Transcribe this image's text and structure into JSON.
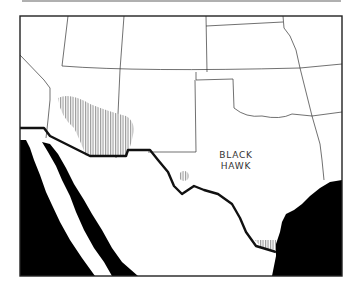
{
  "map": {
    "species_label_line1": "BLACK",
    "species_label_line2": "HAWK",
    "legend": {
      "range_pattern": "vertical-hatch",
      "range_color": "#9a9a9a"
    },
    "colors": {
      "land": "#ffffff",
      "water": "#000000",
      "border": "#111111",
      "state_line": "#333333",
      "hatch": "#8c8c8c"
    },
    "regions_depicted": [
      "Arizona",
      "New Mexico",
      "Texas",
      "Oklahoma",
      "Kansas",
      "Colorado",
      "Utah",
      "Nevada",
      "Mexico",
      "Baja California",
      "Gulf of California",
      "Gulf of Mexico",
      "Pacific Ocean"
    ]
  }
}
